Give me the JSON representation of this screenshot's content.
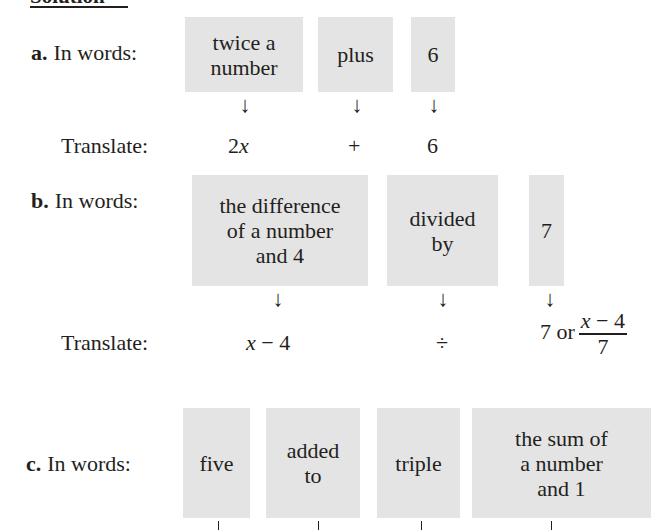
{
  "heading": "Solution",
  "parts": {
    "a": {
      "letter": "a.",
      "words_label": "In words:",
      "translate_label": "Translate:",
      "boxes": [
        "twice a\nnumber",
        "plus",
        "6"
      ],
      "translations": [
        "2",
        "x",
        "+",
        "6"
      ]
    },
    "b": {
      "letter": "b.",
      "words_label": "In words:",
      "translate_label": "Translate:",
      "boxes": [
        "the difference\nof a number\nand 4",
        "divided\nby",
        "7"
      ],
      "translations": {
        "first_var": "x",
        "first_rest": "− 4",
        "operator": "÷",
        "third_prefix": "7 or",
        "fraction_num_var": "x",
        "fraction_num_rest": "− 4",
        "fraction_den": "7"
      }
    },
    "c": {
      "letter": "c.",
      "words_label": "In words:",
      "boxes": [
        "five",
        "added\nto",
        "triple",
        "the sum of\na number\nand 1"
      ]
    }
  },
  "arrow_glyph": "↓"
}
